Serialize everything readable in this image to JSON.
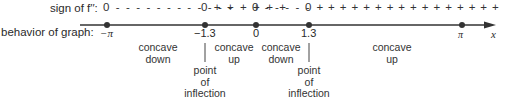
{
  "row_labels": {
    "sign": "sign of f′′:",
    "behavior": "behavior of graph:"
  },
  "sign_segments": [
    {
      "text": "0 - - - - - - - - - - - -"
    },
    {
      "text": "0 + + + + + +"
    },
    {
      "text": "0 - - - - -"
    },
    {
      "text": "0 + + + + + + + + + + + + + + + +"
    },
    {
      "text": "0"
    }
  ],
  "axis": {
    "variable": "x",
    "points": [
      {
        "label": "−π",
        "value": -3.14159
      },
      {
        "label": "−1.3",
        "value": -1.3
      },
      {
        "label": "0",
        "value": 0
      },
      {
        "label": "1.3",
        "value": 1.3
      },
      {
        "label": "π",
        "value": 3.14159
      }
    ]
  },
  "intervals": [
    {
      "label": "concave\ndown"
    },
    {
      "label": "concave\nup"
    },
    {
      "label": "concave\ndown"
    },
    {
      "label": "concave\nup"
    }
  ],
  "inflection_points": [
    {
      "at": "−1.3",
      "label": "point\nof\ninflection"
    },
    {
      "at": "1.3",
      "label": "point\nof\ninflection"
    }
  ]
}
